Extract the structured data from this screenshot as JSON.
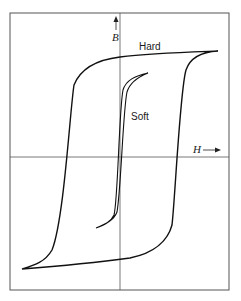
{
  "diagram": {
    "type": "hysteresis-loops",
    "axes": {
      "x_label": "H",
      "y_label": "B",
      "x_arrow": "→",
      "y_arrow": "↑"
    },
    "curves": [
      {
        "name": "hard",
        "label": "Hard"
      },
      {
        "name": "soft",
        "label": "Soft"
      }
    ],
    "colors": {
      "frame": "#555555",
      "axis": "#555555",
      "curve": "#111111",
      "background": "#ffffff"
    }
  }
}
